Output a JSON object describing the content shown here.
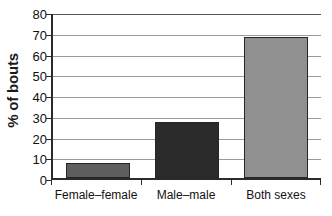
{
  "chart_data": {
    "type": "bar",
    "title": "",
    "xlabel": "",
    "ylabel": "% of bouts",
    "categories": [
      "Female–female",
      "Male–male",
      "Both sexes"
    ],
    "values": [
      7,
      27,
      68
    ],
    "ylim": [
      0,
      80
    ],
    "ytick_step": 10,
    "yticks": [
      0,
      10,
      20,
      30,
      40,
      50,
      60,
      70,
      80
    ],
    "ytick_labels": [
      "0",
      "10",
      "20",
      "30",
      "40",
      "50",
      "60",
      "70",
      "80"
    ],
    "grid": "horizontal",
    "legend": "none",
    "bar_colors": [
      "#5e5e5e",
      "#2b2b2b",
      "#909090"
    ],
    "bar_border_color": "#262626",
    "axis_color": "#2b2b2b",
    "gridline_color": "#9a9a9a",
    "background": "#ffffff"
  },
  "axes": {
    "y_title": "% of bouts"
  }
}
